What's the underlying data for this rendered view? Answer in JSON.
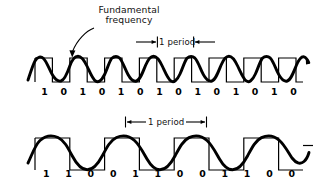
{
  "figure": {
    "title_annotation": {
      "line1": "Fundamental",
      "line2": "frequency",
      "pointer_icon": "curved-arrow-icon"
    },
    "top_diagram": {
      "name": "nrz-alternating-bits-waveform",
      "period_marker": {
        "label": "1 period",
        "arrow_style": "inward",
        "left_arrow_icon": "arrow-right-icon",
        "right_arrow_icon": "arrow-left-icon"
      },
      "bits": [
        "1",
        "0",
        "1",
        "0",
        "1",
        "0",
        "1",
        "0",
        "1",
        "0",
        "1",
        "0",
        "1",
        "0"
      ],
      "bits_per_period": 2,
      "sine_cycles": 7
    },
    "bottom_diagram": {
      "name": "nrz-paired-bits-waveform",
      "period_marker": {
        "label": "1 period",
        "arrow_style": "outward",
        "left_arrow_icon": "arrow-left-icon",
        "right_arrow_icon": "arrow-right-icon"
      },
      "bits": [
        "1",
        "1",
        "0",
        "0",
        "1",
        "1",
        "0",
        "0",
        "1",
        "1",
        "0",
        "0"
      ],
      "bits_per_period": 4,
      "sine_cycles": 3
    },
    "colors": {
      "ink": "#000000",
      "background": "#ffffff",
      "sine_stroke": "#000000",
      "square_stroke": "#000000"
    }
  }
}
